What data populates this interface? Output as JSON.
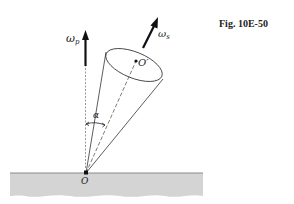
{
  "figure": {
    "caption": "Fig. 10E-50",
    "labels": {
      "omega_p": "ω",
      "omega_p_sub": "p",
      "omega_s": "ω",
      "omega_s_sub": "s",
      "center_top": "O′",
      "apex": "O",
      "angle": "α"
    },
    "colors": {
      "ground_fill": "#d4d4d4",
      "ground_edge": "#8a8a8a",
      "line": "#333333",
      "arrow": "#111111"
    }
  }
}
